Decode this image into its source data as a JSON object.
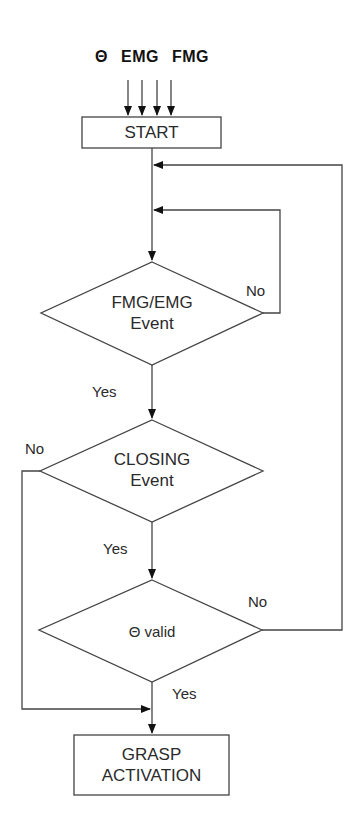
{
  "diagram": {
    "inputs": [
      "Θ",
      "EMG",
      "FMG"
    ],
    "nodes": {
      "start": {
        "type": "process",
        "label": "START"
      },
      "fmg_emg": {
        "type": "decision",
        "line1": "FMG/EMG",
        "line2": "Event"
      },
      "closing": {
        "type": "decision",
        "line1": "CLOSING",
        "line2": "Event"
      },
      "theta_valid": {
        "type": "decision",
        "label": "Θ valid"
      },
      "grasp": {
        "type": "process",
        "line1": "GRASP",
        "line2": "ACTIVATION"
      }
    },
    "edge_labels": {
      "fmg_no": "No",
      "fmg_yes": "Yes",
      "closing_no": "No",
      "closing_yes": "Yes",
      "theta_no": "No",
      "theta_yes": "Yes"
    },
    "colors": {
      "line": "#333333",
      "text": "#2a2a2a",
      "background": "#ffffff"
    }
  }
}
